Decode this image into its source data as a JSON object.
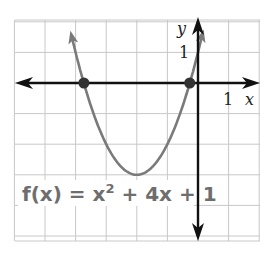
{
  "chart_data": {
    "type": "line",
    "title": "",
    "function": "f(x) = x^2 + 4x + 1",
    "equation_label": {
      "prefix": "f(x) = x",
      "exponent": "2",
      "suffix": " + 4x + 1"
    },
    "xlabel": "x",
    "ylabel": "y",
    "x_tick_label": "1",
    "y_tick_label": "1",
    "xlim": [
      -6,
      2
    ],
    "ylim": [
      -5,
      2
    ],
    "grid": true,
    "vertex": [
      -2,
      -3
    ],
    "x_intercepts": [
      -3.73,
      -0.27
    ],
    "series": [
      {
        "name": "f(x) = x^2 + 4x + 1",
        "color": "#7a7a7a",
        "x": [
          -4.2,
          -4,
          -3.73,
          -3.5,
          -3,
          -2.5,
          -2,
          -1.5,
          -1,
          -0.5,
          -0.27,
          0,
          0.2
        ],
        "y": [
          2.24,
          1,
          0,
          -0.75,
          -2,
          -2.75,
          -3,
          -2.75,
          -2,
          -0.75,
          0,
          1,
          1.84
        ]
      }
    ],
    "colors": {
      "grid": "#c8c8c8",
      "axes": "#111111",
      "curve": "#7a7a7a",
      "equation_text": "#6e6e6e"
    }
  }
}
